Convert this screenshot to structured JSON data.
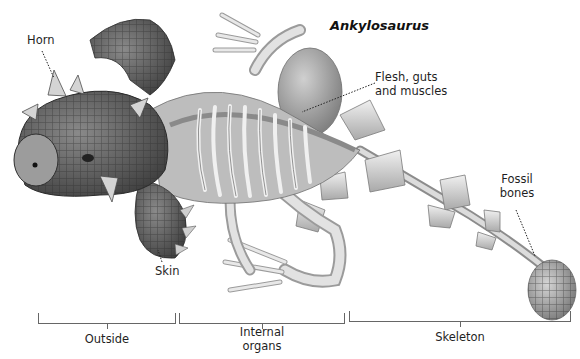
{
  "title": "Ankylosaurus",
  "callouts": {
    "horn": "Horn",
    "flesh": [
      "Flesh, guts",
      "and muscles"
    ],
    "skin": "Skin",
    "fossil": [
      "Fossil",
      "bones"
    ]
  },
  "sections": [
    {
      "label": "Outside"
    },
    {
      "label": "Internal",
      "label2": "organs"
    },
    {
      "label": "Skeleton"
    }
  ],
  "colors": {
    "ink": "#1f1f1f",
    "bracket": "#666666",
    "skin_dark": "#4a4a4a",
    "skin_mid": "#7a7a7a",
    "bone": "#d8d8d8",
    "muscle": "#a6a6a6"
  }
}
